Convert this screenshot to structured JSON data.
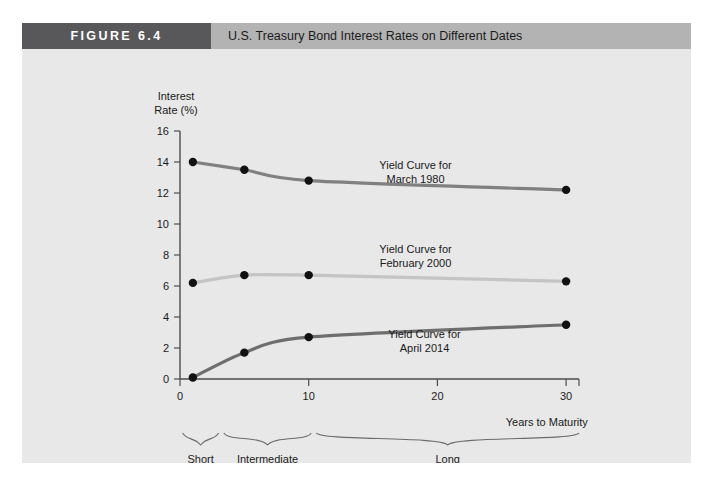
{
  "figure": {
    "tag_label": "FIGURE 6.4",
    "title": "U.S. Treasury Bond Interest Rates on Different Dates",
    "tag_bg": "#58585a",
    "header_bg": "#b3b3b3",
    "panel_bg": "#e8e8e8"
  },
  "chart_data": {
    "type": "line",
    "title": "U.S. Treasury Bond Interest Rates on Different Dates",
    "xlabel": "Years to Maturity",
    "ylabel": "Interest Rate (%)",
    "xlim": [
      0,
      31
    ],
    "ylim": [
      0,
      16
    ],
    "xticks": [
      0,
      10,
      20,
      30
    ],
    "yticks": [
      0,
      2,
      4,
      6,
      8,
      10,
      12,
      14,
      16
    ],
    "grid": false,
    "legend": "inline-annotations",
    "series": [
      {
        "name": "Yield Curve for March 1980",
        "label_line1": "Yield Curve for",
        "label_line2": "March 1980",
        "color": "#808080",
        "x": [
          1,
          5,
          10,
          30
        ],
        "values": [
          14.0,
          13.5,
          12.8,
          12.2
        ]
      },
      {
        "name": "Yield Curve for February 2000",
        "label_line1": "Yield Curve for",
        "label_line2": "February 2000",
        "color": "#c4c4c4",
        "x": [
          1,
          5,
          10,
          30
        ],
        "values": [
          6.2,
          6.7,
          6.7,
          6.3
        ]
      },
      {
        "name": "Yield Curve for April 2014",
        "label_line1": "Yield Curve for",
        "label_line2": "April 2014",
        "color": "#6e6e6e",
        "x": [
          1,
          5,
          10,
          30
        ],
        "values": [
          0.1,
          1.7,
          2.7,
          3.5
        ]
      }
    ],
    "maturity_brackets": [
      {
        "label_line1": "Short",
        "label_line2": "Term",
        "x_start": 0.2,
        "x_end": 3.0
      },
      {
        "label_line1": "Intermediate",
        "label_line2": "Term",
        "x_start": 3.4,
        "x_end": 10.2
      },
      {
        "label_line1": "Long",
        "label_line2": "Term",
        "x_start": 10.6,
        "x_end": 31.0
      }
    ]
  }
}
